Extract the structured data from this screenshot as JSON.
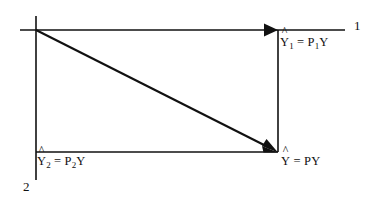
{
  "figure": {
    "type": "orthogonal-projection-decomposition-diagram",
    "width": 380,
    "height": 207,
    "background_color": "#ffffff",
    "line_color": "#111111",
    "labels": {
      "yhat1": {
        "base": "Y",
        "hat": "^",
        "sub": "1",
        "equals": "=",
        "rhs_symbol": "P",
        "rhs_sub": "1",
        "rhs_tail": "Y",
        "plain": "Ŷ1 = P1Y"
      },
      "yhat2": {
        "base": "Y",
        "hat": "^",
        "sub": "2",
        "equals": "=",
        "rhs_symbol": "P",
        "rhs_sub": "2",
        "rhs_tail": "Y",
        "plain": "Ŷ2 = P2Y"
      },
      "yhat": {
        "base": "Y",
        "hat": "^",
        "sub": "",
        "equals": "=",
        "rhs_symbol": "P",
        "rhs_sub": "",
        "rhs_tail": "Y",
        "plain": "Ŷ = PY"
      },
      "axis_1": "1",
      "axis_2": "2"
    },
    "geometry": {
      "origin": {
        "x": 36,
        "y": 30
      },
      "axis1_line": {
        "x1": 20,
        "y1": 30,
        "x2": 345,
        "y2": 30
      },
      "axis2_line": {
        "x1": 36,
        "y1": 16,
        "x2": 36,
        "y2": 180
      },
      "projection_vertical": {
        "x1": 278,
        "y1": 30,
        "x2": 278,
        "y2": 152
      },
      "projection_horizontal": {
        "x1": 36,
        "y1": 152,
        "x2": 278,
        "y2": 152
      },
      "diagonal_vector": {
        "x1": 36,
        "y1": 30,
        "x2": 277,
        "y2": 152
      },
      "arrow_axis1_tip": {
        "x": 278,
        "y": 30
      },
      "arrow_diagonal_tip": {
        "x": 277,
        "y": 152
      }
    }
  }
}
